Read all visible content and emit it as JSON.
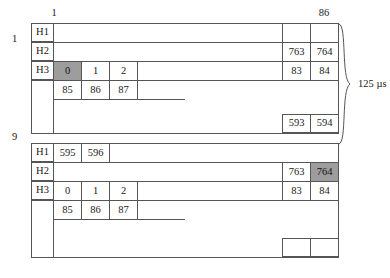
{
  "figure": {
    "duration_label": "125 µs",
    "frame_start_label": "1",
    "frame_end_label": "86",
    "row_labels": {
      "top_block": "1",
      "bottom_block": "9"
    },
    "header_names": {
      "h1": "H1",
      "h2": "H2",
      "h3": "H3"
    },
    "colors": {
      "line": "#555555",
      "shade": "#9d9d9d",
      "background": "#ffffff"
    }
  },
  "blocks": [
    {
      "id": "block-top",
      "index_label": "1",
      "rows": [
        {
          "name": "H1",
          "label": "H1",
          "left_cells": [],
          "right_cells": [
            {
              "value": "",
              "shaded": false
            },
            {
              "value": "",
              "shaded": false
            }
          ]
        },
        {
          "name": "H2",
          "label": "H2",
          "left_cells": [],
          "right_cells": [
            {
              "value": "763",
              "shaded": false
            },
            {
              "value": "764",
              "shaded": false
            }
          ]
        },
        {
          "name": "H3",
          "label": "H3",
          "left_cells": [
            {
              "value": "0",
              "shaded": true
            },
            {
              "value": "1",
              "shaded": false
            },
            {
              "value": "2",
              "shaded": false
            }
          ],
          "right_cells": [
            {
              "value": "83",
              "shaded": false
            },
            {
              "value": "84",
              "shaded": false
            }
          ]
        },
        {
          "name": "payload",
          "label": "",
          "left_cells": [
            {
              "value": "85",
              "shaded": false
            },
            {
              "value": "86",
              "shaded": false
            },
            {
              "value": "87",
              "shaded": false
            }
          ],
          "right_cells": []
        }
      ],
      "tail_cells": [
        {
          "value": "593",
          "shaded": false
        },
        {
          "value": "594",
          "shaded": false
        }
      ]
    },
    {
      "id": "block-bottom",
      "index_label": "9",
      "rows": [
        {
          "name": "H1",
          "label": "H1",
          "left_cells": [
            {
              "value": "595",
              "shaded": false
            },
            {
              "value": "596",
              "shaded": false
            }
          ],
          "right_cells": []
        },
        {
          "name": "H2",
          "label": "H2",
          "left_cells": [],
          "right_cells": [
            {
              "value": "763",
              "shaded": false
            },
            {
              "value": "764",
              "shaded": true
            }
          ]
        },
        {
          "name": "H3",
          "label": "H3",
          "left_cells": [
            {
              "value": "0",
              "shaded": false
            },
            {
              "value": "1",
              "shaded": false
            },
            {
              "value": "2",
              "shaded": false
            }
          ],
          "right_cells": [
            {
              "value": "83",
              "shaded": false
            },
            {
              "value": "84",
              "shaded": false
            }
          ]
        },
        {
          "name": "payload",
          "label": "",
          "left_cells": [
            {
              "value": "85",
              "shaded": false
            },
            {
              "value": "86",
              "shaded": false
            },
            {
              "value": "87",
              "shaded": false
            }
          ],
          "right_cells": []
        }
      ],
      "tail_cells": [
        {
          "value": "",
          "shaded": false
        },
        {
          "value": "",
          "shaded": false
        }
      ]
    }
  ]
}
